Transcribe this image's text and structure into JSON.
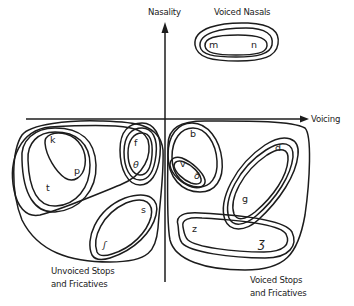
{
  "axes": {
    "vertical_label": "Nasality",
    "horizontal_label": "Voicing"
  },
  "groups": {
    "voiced_nasals": "Voiced Nasals",
    "unvoiced_line1": "Unvoiced Stops",
    "unvoiced_line2": "and Fricatives",
    "voiced_line1": "Voiced Stops",
    "voiced_line2": "and Fricatives"
  },
  "phonemes": {
    "m": "m",
    "n": "n",
    "k": "k",
    "p": "p",
    "t": "t",
    "f": "f",
    "theta": "θ",
    "s": "s",
    "esh": "ʃ",
    "b": "b",
    "v": "v",
    "eth": "ð",
    "d": "d",
    "g": "g",
    "z": "z",
    "ezh": "ʒ"
  },
  "colors": {
    "ink": "#1c1c1c",
    "background": "#ffffff"
  }
}
